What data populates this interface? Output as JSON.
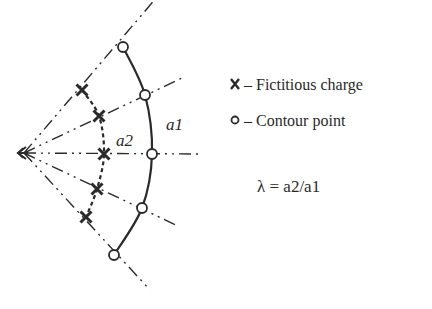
{
  "diagram": {
    "title": "",
    "labels": {
      "outer_radius": "a1",
      "inner_radius": "a2"
    },
    "legend": [
      {
        "symbol": "x",
        "text": "– Fictitious charge",
        "marker": "cross"
      },
      {
        "symbol": "o",
        "text": "– Contour point",
        "marker": "circle"
      }
    ],
    "formula": "λ = a2/a1",
    "contour_points_count": 5,
    "fictitious_charges_count": 5,
    "colors": {
      "ink": "#2a2a2a",
      "background": "#ffffff"
    }
  }
}
